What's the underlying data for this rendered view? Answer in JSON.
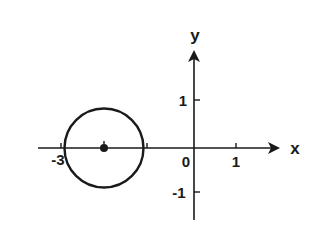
{
  "diagram": {
    "type": "coordinate-plane",
    "axes": {
      "x_label": "x",
      "y_label": "y",
      "x_ticks": [
        {
          "value": -3,
          "label": "-3"
        },
        {
          "value": -1,
          "label": ""
        },
        {
          "value": 0,
          "label": "0"
        },
        {
          "value": 1,
          "label": "1"
        }
      ],
      "y_ticks": [
        {
          "value": 1,
          "label": "1"
        },
        {
          "value": -1,
          "label": "-1"
        }
      ],
      "origin_label": "0"
    },
    "shapes": [
      {
        "kind": "circle",
        "center": [
          -2,
          0
        ],
        "radius": 0.9,
        "stroke": "#1a1a1a",
        "fill": "none"
      },
      {
        "kind": "point",
        "at": [
          -2,
          0
        ],
        "fill": "#1a1a1a"
      }
    ],
    "colors": {
      "ink": "#1a1a1a",
      "background": "#ffffff"
    }
  }
}
